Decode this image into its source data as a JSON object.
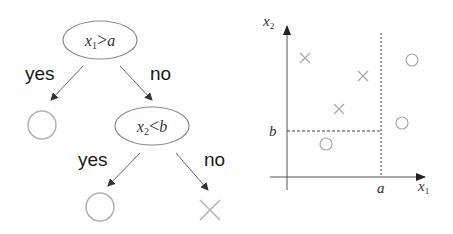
{
  "tree": {
    "root": {
      "var": "x",
      "sub": "1",
      "op": ">",
      "threshold": "a",
      "yes_label": "yes",
      "no_label": "no"
    },
    "left_leaf": {
      "class": "circle"
    },
    "inner": {
      "var": "x",
      "sub": "2",
      "op": "<",
      "threshold": "b",
      "yes_label": "yes",
      "no_label": "no"
    },
    "inner_yes_leaf": {
      "class": "circle"
    },
    "inner_no_leaf": {
      "class": "cross"
    }
  },
  "plot": {
    "x_axis": {
      "var": "x",
      "sub": "1",
      "tick_label": "a"
    },
    "y_axis": {
      "var": "x",
      "sub": "2",
      "tick_label": "b"
    },
    "points": [
      {
        "class": "cross",
        "x": 305,
        "y": 58
      },
      {
        "class": "cross",
        "x": 363,
        "y": 76
      },
      {
        "class": "cross",
        "x": 339,
        "y": 109
      },
      {
        "class": "circle",
        "x": 412,
        "y": 60
      },
      {
        "class": "circle",
        "x": 402,
        "y": 123
      },
      {
        "class": "circle",
        "x": 326,
        "y": 144
      }
    ]
  },
  "colors": {
    "node_stroke": "#8a8a8a",
    "leaf_stroke": "#b3b3b3",
    "arrow": "#555555",
    "axis": "#555555",
    "text": "#1a1a1a"
  }
}
